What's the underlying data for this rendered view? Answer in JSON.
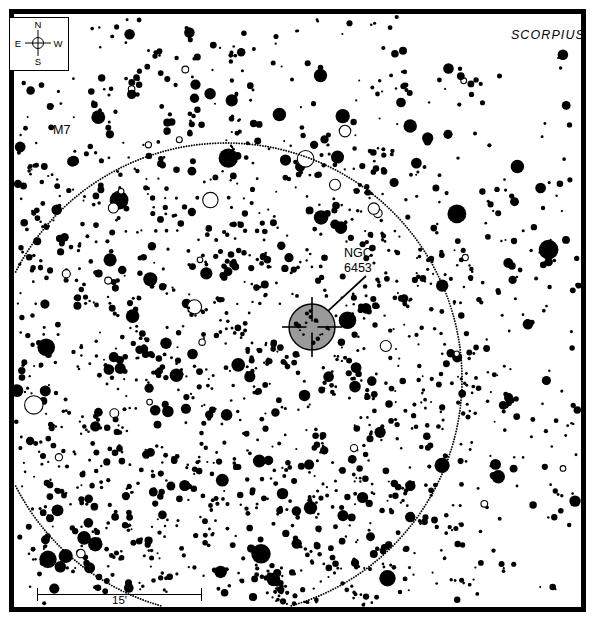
{
  "chart_data": {
    "type": "scatter",
    "title": "",
    "subtitle": "",
    "xlabel": "",
    "ylabel": "",
    "grid": false,
    "legend_position": "none",
    "constellation_label": "SCORPIUS",
    "objects": [
      {
        "name": "M7",
        "type": "open-cluster",
        "marker": "dotted-circle",
        "label": "M7",
        "center_x": 212,
        "center_y": 365,
        "radius_px": 236
      },
      {
        "name": "NGC 6453",
        "type": "globular-cluster",
        "marker": "shaded-circle-crosshair",
        "label": "NGC 6453",
        "center_x": 298,
        "center_y": 313,
        "radius_px": 23
      }
    ],
    "scale_bar": {
      "label": "15'",
      "length_px": 165,
      "units": "arcminutes",
      "value": 15
    },
    "compass": {
      "north": "N",
      "south": "S",
      "east": "E",
      "west": "W",
      "north_direction": "up",
      "east_direction": "left"
    },
    "star_magnitude_marker_sizes_px": [
      1,
      2,
      3,
      4,
      5,
      6,
      7,
      8,
      9,
      11
    ],
    "field_note": "Star density is much higher in the left and lower-left portion of the field (within the M7 cluster boundary) than toward the right."
  },
  "chart": {
    "constellation": "SCORPIUS",
    "cluster_label": "M7",
    "target_label_line1": "NGC",
    "target_label_line2": "6453",
    "scale_label": "15'"
  },
  "compass": {
    "north": "N",
    "south": "S",
    "east": "E",
    "west": "W"
  },
  "caption": {
    "text": ""
  },
  "colors": {
    "frame": "#000000",
    "background": "#ffffff",
    "star": "#000000",
    "target_fill": "#9a9a9a",
    "target_stroke": "#000000",
    "dotted_circle": "#000000"
  }
}
